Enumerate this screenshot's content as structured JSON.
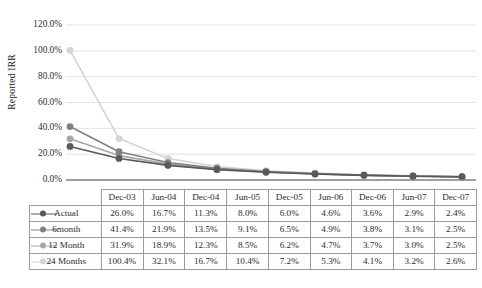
{
  "chart_data": {
    "type": "line",
    "title": "",
    "xlabel": "",
    "ylabel": "Reported IRR",
    "ylim": [
      0,
      120
    ],
    "ytick_labels": [
      "120.0%",
      "100.0%",
      "80.0%",
      "60.0%",
      "40.0%",
      "20.0%",
      "0.0%"
    ],
    "ytick_values": [
      120,
      100,
      80,
      60,
      40,
      20,
      0
    ],
    "grid": true,
    "legend_position": "table",
    "categories": [
      "Dec-03",
      "Jun-04",
      "Dec-04",
      "Jun-05",
      "Dec-05",
      "Jun-06",
      "Dec-06",
      "Jun-07",
      "Dec-07"
    ],
    "series": [
      {
        "name": "Actual",
        "color": "#595959",
        "values": [
          26.0,
          16.7,
          11.3,
          8.0,
          6.0,
          4.6,
          3.6,
          2.9,
          2.4
        ],
        "labels": [
          "26.0%",
          "16.7%",
          "11.3%",
          "8.0%",
          "6.0%",
          "4.6%",
          "3.6%",
          "2.9%",
          "2.4%"
        ]
      },
      {
        "name": "6month",
        "color": "#808080",
        "values": [
          41.4,
          21.9,
          13.5,
          9.1,
          6.5,
          4.9,
          3.8,
          3.1,
          2.5
        ],
        "labels": [
          "41.4%",
          "21.9%",
          "13.5%",
          "9.1%",
          "6.5%",
          "4.9%",
          "3.8%",
          "3.1%",
          "2.5%"
        ]
      },
      {
        "name": "12 Month",
        "color": "#a6a6a6",
        "values": [
          31.9,
          18.9,
          12.3,
          8.5,
          6.2,
          4.7,
          3.7,
          3.0,
          2.5
        ],
        "labels": [
          "31.9%",
          "18.9%",
          "12.3%",
          "8.5%",
          "6.2%",
          "4.7%",
          "3.7%",
          "3.0%",
          "2.5%"
        ]
      },
      {
        "name": "24 Months",
        "color": "#d4d4d4",
        "values": [
          100.4,
          32.1,
          16.7,
          10.4,
          7.2,
          5.3,
          4.1,
          3.2,
          2.6
        ],
        "labels": [
          "100.4%",
          "32.1%",
          "16.7%",
          "10.4%",
          "7.2%",
          "5.3%",
          "4.1%",
          "3.2%",
          "2.6%"
        ]
      }
    ]
  },
  "table": {
    "corner_label": "",
    "column_headers": [
      "Dec-03",
      "Jun-04",
      "Dec-04",
      "Jun-05",
      "Dec-05",
      "Jun-06",
      "Dec-06",
      "Jun-07",
      "Dec-07"
    ],
    "rows": [
      {
        "label": "Actual",
        "color": "#595959",
        "cells": [
          "26.0%",
          "16.7%",
          "11.3%",
          "8.0%",
          "6.0%",
          "4.6%",
          "3.6%",
          "2.9%",
          "2.4%"
        ]
      },
      {
        "label": "6month",
        "color": "#808080",
        "cells": [
          "41.4%",
          "21.9%",
          "13.5%",
          "9.1%",
          "6.5%",
          "4.9%",
          "3.8%",
          "3.1%",
          "2.5%"
        ]
      },
      {
        "label": "12 Month",
        "color": "#a6a6a6",
        "cells": [
          "31.9%",
          "18.9%",
          "12.3%",
          "8.5%",
          "6.2%",
          "4.7%",
          "3.7%",
          "3.0%",
          "2.5%"
        ]
      },
      {
        "label": "24 Months",
        "color": "#d4d4d4",
        "cells": [
          "100.4%",
          "32.1%",
          "16.7%",
          "10.4%",
          "7.2%",
          "5.3%",
          "4.1%",
          "3.2%",
          "2.6%"
        ]
      }
    ]
  },
  "caption": {
    "text": ""
  },
  "colors": {
    "gridline": "#e2e2e2",
    "axis": "#7f7f7f",
    "table_border": "#9a9a9a"
  }
}
